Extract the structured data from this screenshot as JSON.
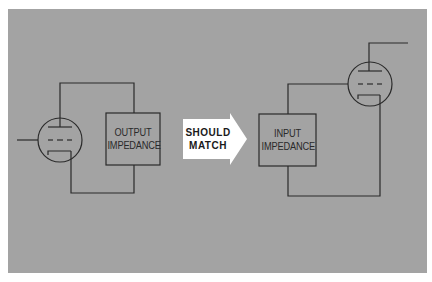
{
  "diagram": {
    "colors": {
      "background": "#ffffff",
      "panel": "#a3a3a3",
      "line": "#2a2a2a",
      "arrow_fill": "#ffffff"
    },
    "left_stage": {
      "component": "vacuum-tube",
      "box": {
        "line1": "OUTPUT",
        "line2": "IMPEDANCE"
      }
    },
    "arrow": {
      "line1": "SHOULD",
      "line2": "MATCH"
    },
    "right_stage": {
      "component": "vacuum-tube",
      "box": {
        "line1": "INPUT",
        "line2": "IMPEDANCE"
      }
    }
  }
}
